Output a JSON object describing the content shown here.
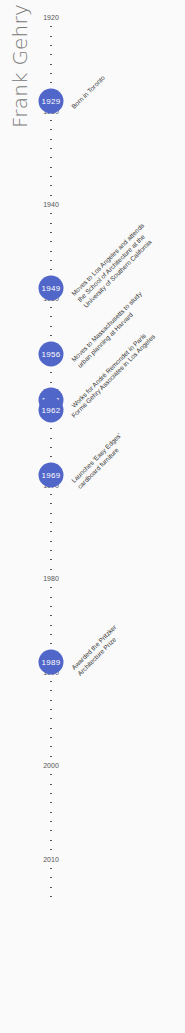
{
  "title": "Frank Gehry",
  "colors": {
    "circle": "#5066c8",
    "title": "#777777",
    "text": "#333333",
    "background": "#fafafa"
  },
  "axis": {
    "start_year": 1920,
    "end_year": 2014,
    "px_per_year": 9.35,
    "top_px": 17,
    "labels": [
      "1920",
      "1930",
      "1940",
      "1950",
      "1960",
      "1970",
      "1980",
      "1990",
      "2000",
      "2010"
    ]
  },
  "events": [
    {
      "year": "1929",
      "lines": [
        "Born in Toronto"
      ]
    },
    {
      "year": "1949",
      "lines": [
        "Moves to Los Angeles and attends",
        "the School of Architecture at the",
        "University of Southern California"
      ]
    },
    {
      "year": "1956",
      "lines": [
        "Moves to Massachusetts to study",
        "urban planning at Harvard"
      ]
    },
    {
      "year": "1961",
      "lines": [
        "Works for André Remondet in Paris"
      ]
    },
    {
      "year": "1962",
      "lines": [
        "Forms Gehry Associates in Los Angeles"
      ]
    },
    {
      "year": "1969",
      "lines": [
        "Launches 'Easy Edges'",
        "cardboard furniture"
      ]
    },
    {
      "year": "1989",
      "lines": [
        "Awarded the Pritzker",
        "Architecture Prize"
      ]
    }
  ]
}
